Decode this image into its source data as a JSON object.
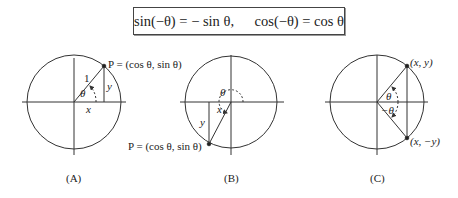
{
  "formula": {
    "sin_identity": "sin(−θ) = − sin θ,",
    "cos_identity": "cos(−θ) = cos θ"
  },
  "diagrams": [
    {
      "id": "A",
      "caption": "(A)",
      "point_label": "P = (cos θ, sin θ)",
      "radius_label": "1",
      "angle_label": "θ",
      "x_label": "x",
      "y_label": "y"
    },
    {
      "id": "B",
      "caption": "(B)",
      "point_label": "P = (cos θ, sin θ)",
      "angle_label": "θ",
      "x_label": "x",
      "y_label": "y"
    },
    {
      "id": "C",
      "caption": "(C)",
      "point_upper_label": "(x, y)",
      "point_lower_label": "(x, −y)",
      "angle_upper_label": "θ",
      "angle_lower_label": "−θ"
    }
  ],
  "colors": {
    "stroke": "#333333",
    "background": "#ffffff"
  }
}
